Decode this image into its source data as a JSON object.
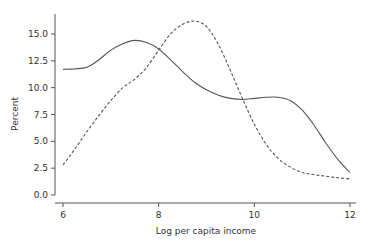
{
  "chart_data": {
    "type": "line",
    "title": "",
    "xlabel": "Log per capita income",
    "ylabel": "Percent",
    "xlim": [
      6,
      12
    ],
    "ylim": [
      0,
      16.5
    ],
    "xticks": [
      6,
      8,
      10,
      12
    ],
    "xtick_labels": [
      "6",
      "8",
      "10",
      "12"
    ],
    "yticks": [
      0,
      2.5,
      5,
      7.5,
      10,
      12.5,
      15
    ],
    "ytick_labels": [
      "0.0",
      "2.5",
      "5.0",
      "7.5",
      "10.0",
      "12.5",
      "15.0"
    ],
    "grid": false,
    "legend": null,
    "series": [
      {
        "name": "solid",
        "style": "solid",
        "color": "#555555",
        "x": [
          6.0,
          6.25,
          6.5,
          6.75,
          7.0,
          7.25,
          7.5,
          7.75,
          8.0,
          8.25,
          8.5,
          8.75,
          9.0,
          9.25,
          9.5,
          9.75,
          10.0,
          10.25,
          10.5,
          10.75,
          11.0,
          11.25,
          11.5,
          11.75,
          12.0
        ],
        "values": [
          11.7,
          11.75,
          11.9,
          12.6,
          13.5,
          14.1,
          14.4,
          14.2,
          13.6,
          12.6,
          11.5,
          10.5,
          9.8,
          9.3,
          9.0,
          8.9,
          9.0,
          9.1,
          9.1,
          8.8,
          7.9,
          6.5,
          4.8,
          3.3,
          2.1
        ]
      },
      {
        "name": "dashed",
        "style": "dashed",
        "color": "#555555",
        "x": [
          6.0,
          6.25,
          6.5,
          6.75,
          7.0,
          7.25,
          7.5,
          7.75,
          8.0,
          8.25,
          8.5,
          8.75,
          9.0,
          9.25,
          9.5,
          9.75,
          10.0,
          10.25,
          10.5,
          10.75,
          11.0,
          11.25,
          11.5,
          11.75,
          12.0
        ],
        "values": [
          2.8,
          4.3,
          5.9,
          7.4,
          8.8,
          10.0,
          10.8,
          11.9,
          13.5,
          15.0,
          15.9,
          16.2,
          15.7,
          14.0,
          11.6,
          9.0,
          6.6,
          4.7,
          3.4,
          2.6,
          2.1,
          1.9,
          1.75,
          1.6,
          1.5
        ]
      }
    ]
  },
  "layout": {
    "plot_left": 55,
    "plot_right": 356,
    "x_min_px": 63,
    "x_max_px": 350,
    "y_zero_px": 195,
    "y_top_value_px": 34,
    "axis_y_px": 203
  }
}
